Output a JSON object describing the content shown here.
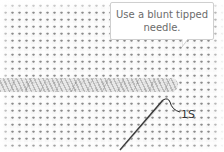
{
  "illustration": {
    "subject": "needlepoint canvas with braided stitch row and needle",
    "callout": {
      "line1": "Use a blunt tipped",
      "line2": "needle."
    },
    "label": "1S",
    "colors": {
      "canvas": "#f6f6f6",
      "thread": "#dcdcdc",
      "callout_border": "#cfcfcf",
      "callout_text": "#6b6b6b",
      "needle": "#3a3a3a"
    }
  }
}
